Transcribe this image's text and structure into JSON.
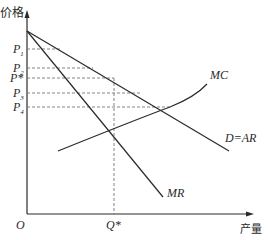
{
  "diagram": {
    "type": "monopoly-price-output",
    "axes": {
      "y_label": "价格",
      "x_label": "产量",
      "origin_label": "O"
    },
    "price_labels": [
      {
        "main": "P",
        "sub": "1",
        "y": 49
      },
      {
        "main": "P",
        "sub": "2",
        "y": 68
      },
      {
        "main": "P*",
        "sub": "",
        "y": 78
      },
      {
        "main": "P",
        "sub": "3",
        "y": 93
      },
      {
        "main": "P",
        "sub": "4",
        "y": 107
      }
    ],
    "quantity_label": "Q*",
    "curves": {
      "mc": "MC",
      "demand": "D=AR",
      "mr": "MR"
    },
    "colors": {
      "line": "#2a2a2a",
      "dashed": "#777777",
      "background": "#ffffff"
    }
  }
}
